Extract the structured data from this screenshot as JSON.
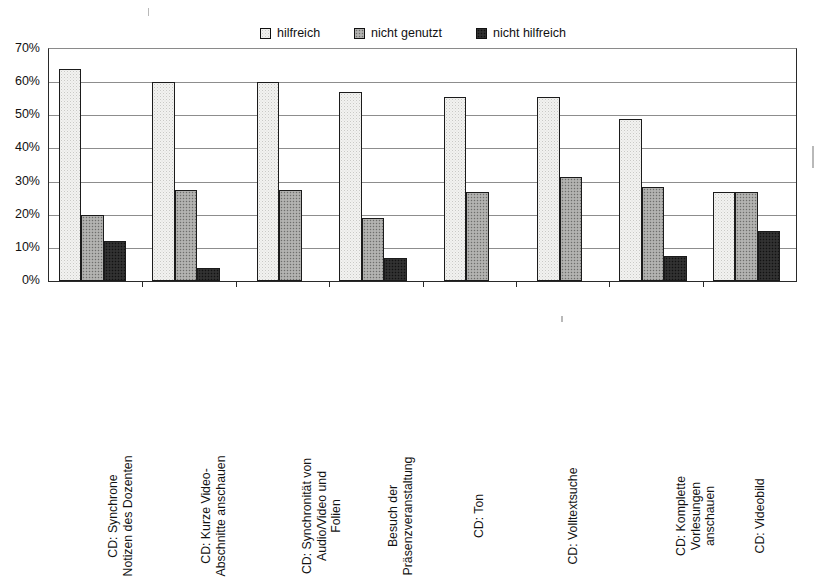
{
  "chart_data": {
    "type": "bar",
    "title": "",
    "xlabel": "",
    "ylabel": "",
    "ylim": [
      0,
      70
    ],
    "ytick_labels": [
      "0%",
      "10%",
      "20%",
      "30%",
      "40%",
      "50%",
      "60%",
      "70%"
    ],
    "ytick_values": [
      0,
      10,
      20,
      30,
      40,
      50,
      60,
      70
    ],
    "grid": true,
    "legend_position": "top-center",
    "categories": [
      "CD: Synchrone Notizen des Dozenten",
      "CD: Kurze Video-Abschnitte anschauen",
      "CD: Synchronität von Audio/Video und Folien",
      "Besuch der Präsenzveranstaltung",
      "CD: Ton",
      "CD: Volltextsuche",
      "CD: Komplette Vorlesungen anschauen",
      "CD: Videobild"
    ],
    "category_lines": [
      [
        "CD: Synchrone",
        "Notizen des Dozenten"
      ],
      [
        "CD: Kurze Video-",
        "Abschnitte anschauen"
      ],
      [
        "CD: Synchronität von",
        "Audio/Video und",
        "Folien"
      ],
      [
        "Besuch der",
        "Präsenzveranstaltung"
      ],
      [
        "CD: Ton"
      ],
      [
        "CD: Volltextsuche"
      ],
      [
        "CD: Komplette",
        "Vorlesungen",
        "anschauen"
      ],
      [
        "CD: Videobild"
      ]
    ],
    "series": [
      {
        "name": "hilfreich",
        "fill": "light",
        "color": "#f2f2f0",
        "values": [
          64,
          60,
          60,
          57,
          55.5,
          55.5,
          49,
          27
        ]
      },
      {
        "name": "nicht genutzt",
        "fill": "mid",
        "color": "#a8a8a6",
        "values": [
          20,
          27.5,
          27.5,
          19,
          27,
          31.5,
          28.5,
          27
        ]
      },
      {
        "name": "nicht hilfreich",
        "fill": "dark",
        "color": "#2b2b2b",
        "values": [
          12,
          4,
          null,
          7,
          null,
          null,
          7.5,
          15
        ]
      }
    ]
  },
  "legend": {
    "items": [
      {
        "label": "hilfreich",
        "fill": "light"
      },
      {
        "label": "nicht genutzt",
        "fill": "mid"
      },
      {
        "label": "nicht hilfreich",
        "fill": "dark"
      }
    ]
  }
}
